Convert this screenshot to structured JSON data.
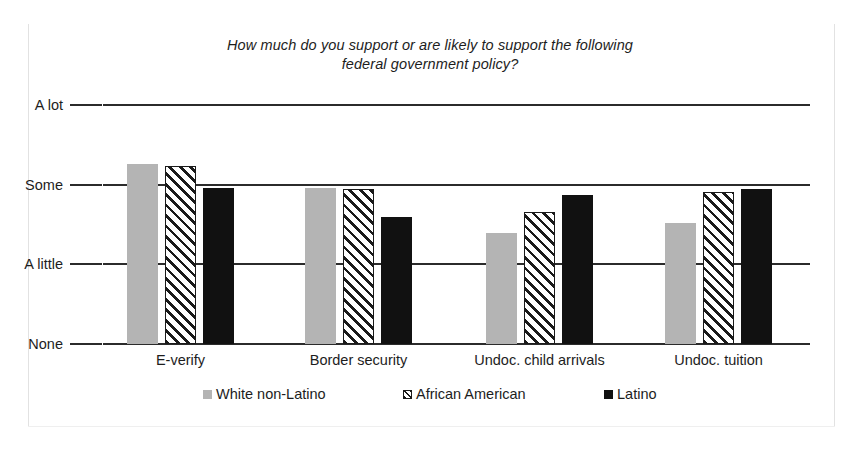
{
  "chart_data": {
    "type": "bar",
    "title": "How much do you support or are likely to support the following federal government policy?",
    "title_line1": "How much do you support or are likely to support the following",
    "title_line2": "federal government policy?",
    "xlabel": "",
    "ylabel": "",
    "grid": true,
    "legend_position": "bottom",
    "categories": [
      "E-verify",
      "Border security",
      "Undoc. child arrivals",
      "Undoc. tuition"
    ],
    "ytick_labels": [
      "None",
      "A little",
      "Some",
      "A lot"
    ],
    "ytick_values": [
      0,
      1,
      2,
      3
    ],
    "ylim": [
      0,
      3
    ],
    "series": [
      {
        "name": "White non-Latino",
        "color": "#b4b4b4",
        "fill": "solid-gray",
        "values": [
          2.26,
          1.96,
          1.39,
          1.52
        ]
      },
      {
        "name": "African American",
        "color": "#1a1a1a",
        "fill": "diagonal-hatch",
        "values": [
          2.23,
          1.94,
          1.66,
          1.91
        ]
      },
      {
        "name": "Latino",
        "color": "#111111",
        "fill": "solid-black",
        "values": [
          1.96,
          1.59,
          1.87,
          1.94
        ]
      }
    ]
  },
  "frame": {
    "border_color": "#e2e2e2",
    "background": "#ffffff"
  }
}
